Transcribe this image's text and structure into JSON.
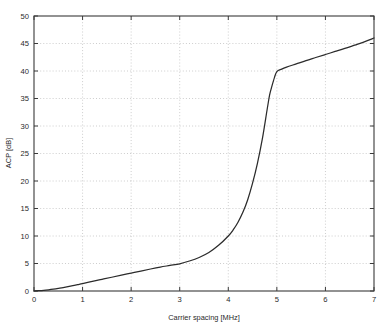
{
  "chart_data": {
    "type": "line",
    "title": "",
    "xlabel": "Carrier spacing [MHz]",
    "ylabel": "ACP [dB]",
    "xlim": [
      0,
      7
    ],
    "ylim": [
      0,
      50
    ],
    "xticks": [
      0,
      1,
      2,
      3,
      4,
      5,
      6,
      7
    ],
    "yticks": [
      0,
      5,
      10,
      15,
      20,
      25,
      30,
      35,
      40,
      45,
      50
    ],
    "xticklabels": [
      "0",
      "1",
      "2",
      "3",
      "4",
      "5",
      "6",
      "7"
    ],
    "yticklabels": [
      "0",
      "5",
      "10",
      "15",
      "20",
      "25",
      "30",
      "35",
      "40",
      "45",
      "50"
    ],
    "grid": true,
    "grid_style": "dotted",
    "legend": null,
    "series": [
      {
        "name": "ACP",
        "color": "#2b2b2b",
        "x": [
          0.0,
          0.1,
          0.2,
          0.3,
          0.4,
          0.5,
          0.6,
          0.7,
          0.8,
          0.9,
          1.0,
          1.2,
          1.4,
          1.6,
          1.8,
          2.0,
          2.2,
          2.4,
          2.6,
          2.8,
          3.0,
          3.2,
          3.4,
          3.6,
          3.8,
          4.0,
          4.1,
          4.2,
          4.3,
          4.4,
          4.5,
          4.6,
          4.7,
          4.8,
          4.85,
          4.9,
          4.95,
          5.0,
          5.1,
          5.2,
          5.4,
          5.6,
          5.8,
          6.0,
          6.2,
          6.4,
          6.6,
          6.8,
          7.0
        ],
        "y": [
          0.0,
          0.05,
          0.12,
          0.22,
          0.34,
          0.48,
          0.63,
          0.8,
          0.98,
          1.17,
          1.35,
          1.75,
          2.12,
          2.5,
          2.88,
          3.25,
          3.62,
          4.0,
          4.35,
          4.65,
          4.95,
          5.45,
          6.1,
          7.0,
          8.3,
          10.0,
          11.1,
          12.5,
          14.3,
          16.6,
          19.6,
          23.2,
          27.6,
          33.0,
          35.6,
          37.3,
          38.8,
          39.9,
          40.35,
          40.7,
          41.3,
          41.9,
          42.45,
          43.0,
          43.55,
          44.1,
          44.7,
          45.3,
          46.0
        ]
      }
    ]
  },
  "axes": {
    "x_tick_labels": [
      "0",
      "1",
      "2",
      "3",
      "4",
      "5",
      "6",
      "7"
    ],
    "y_tick_labels": [
      "0",
      "5",
      "10",
      "15",
      "20",
      "25",
      "30",
      "35",
      "40",
      "45",
      "50"
    ],
    "x_axis_title": "Carrier spacing [MHz]",
    "y_axis_title": "ACP [dB]"
  },
  "colors": {
    "curve": "#2b2b2b",
    "axis": "#3a3a3a",
    "grid": "#b8b8b8",
    "background": "#ffffff",
    "text": "#2a2a2a"
  }
}
